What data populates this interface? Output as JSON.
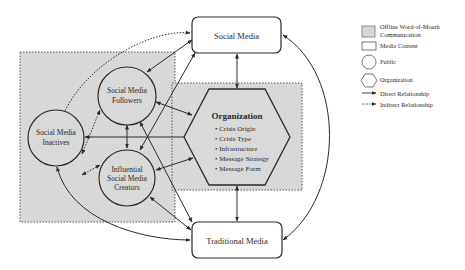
{
  "diagram": {
    "nodes": {
      "social_media": {
        "label": "Social Media",
        "shape": "rounded-rect",
        "type": "Media Content"
      },
      "traditional_media": {
        "label": "Traditional Media",
        "shape": "rounded-rect",
        "type": "Media Content"
      },
      "followers": {
        "line1": "Social Media",
        "line2": "Followers",
        "shape": "circle",
        "type": "Public"
      },
      "inactives": {
        "line1": "Social Media",
        "line2": "Inactives",
        "shape": "circle",
        "type": "Public"
      },
      "creators": {
        "line1": "Influential",
        "line2": "Social Media",
        "line3": "Creators",
        "shape": "circle",
        "type": "Public"
      },
      "organization": {
        "title": "Organization",
        "shape": "hexagon",
        "type": "Organization",
        "bullets": [
          "• Crisis Origin",
          "• Crisis Type",
          "• Infrastructure",
          "• Message Strategy",
          "• Message Form"
        ]
      }
    },
    "regions": [
      {
        "name": "offline-wom-left",
        "type": "Offline Word-of-Mouth Communication"
      },
      {
        "name": "offline-wom-right",
        "type": "Offline Word-of-Mouth Communication"
      }
    ],
    "edges": [
      {
        "from": "inactives",
        "to": "social_media",
        "style": "indirect",
        "direction": "both"
      },
      {
        "from": "inactives",
        "to": "followers",
        "style": "indirect",
        "direction": "both"
      },
      {
        "from": "inactives",
        "to": "creators",
        "style": "indirect",
        "direction": "both"
      },
      {
        "from": "inactives",
        "to": "organization",
        "style": "direct",
        "direction": "both"
      },
      {
        "from": "inactives",
        "to": "traditional_media",
        "style": "direct",
        "direction": "both"
      },
      {
        "from": "followers",
        "to": "social_media",
        "style": "direct",
        "direction": "both"
      },
      {
        "from": "followers",
        "to": "creators",
        "style": "direct",
        "direction": "both"
      },
      {
        "from": "followers",
        "to": "organization",
        "style": "direct",
        "direction": "both"
      },
      {
        "from": "followers",
        "to": "traditional_media",
        "style": "direct",
        "direction": "both"
      },
      {
        "from": "creators",
        "to": "social_media",
        "style": "direct",
        "direction": "both"
      },
      {
        "from": "creators",
        "to": "organization",
        "style": "direct",
        "direction": "both"
      },
      {
        "from": "creators",
        "to": "traditional_media",
        "style": "direct",
        "direction": "both"
      },
      {
        "from": "social_media",
        "to": "organization",
        "style": "direct",
        "direction": "both"
      },
      {
        "from": "organization",
        "to": "traditional_media",
        "style": "direct",
        "direction": "both"
      },
      {
        "from": "social_media",
        "to": "traditional_media",
        "style": "direct",
        "direction": "both"
      }
    ]
  },
  "legend": {
    "items": [
      {
        "swatch": "gray-box",
        "line1": "Offline Word-of-Mouth",
        "line2": "Communication"
      },
      {
        "swatch": "rect",
        "label": "Media Content"
      },
      {
        "swatch": "circle",
        "label": "Public"
      },
      {
        "swatch": "hexagon",
        "label": "Organization"
      },
      {
        "swatch": "solid-arrow",
        "label": "Direct Relationship"
      },
      {
        "swatch": "dotted-arrow",
        "label": "Indirect Relationship"
      }
    ]
  },
  "colors": {
    "region_fill": "#dcdcdc",
    "stroke": "#2a2a2a",
    "background": "#ffffff"
  }
}
